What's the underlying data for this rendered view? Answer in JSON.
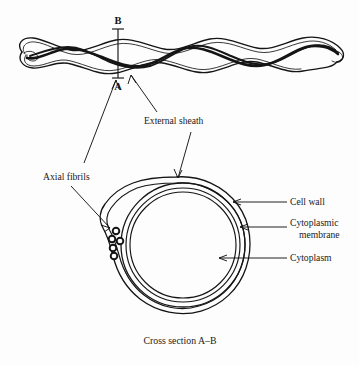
{
  "figure": {
    "caption": "Cross section A–B",
    "background_color": "#fdfdfd",
    "ink_color": "#151515"
  },
  "section_markers": {
    "top_label": "B",
    "bottom_label": "A"
  },
  "labels": {
    "external_sheath": "External sheath",
    "axial_fibrils": "Axial fibrils",
    "cell_wall": "Cell wall",
    "cytoplasmic_membrane_line1": "Cytoplasmic",
    "cytoplasmic_membrane_line2": "membrane",
    "cytoplasm": "Cytoplasm"
  },
  "cross_section": {
    "axial_fibril_count": 5,
    "layer_names": [
      "External sheath",
      "Cell wall",
      "Cytoplasmic membrane",
      "Cytoplasm"
    ]
  }
}
